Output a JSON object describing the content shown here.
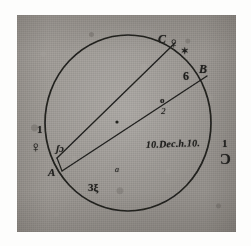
{
  "figure": {
    "kind": "manuscript-astronomical-sketch",
    "medium_note": "ink on aged paper",
    "paper_color": "#a9a5a0",
    "ink_color": "#20201e"
  },
  "circle": {
    "name": "field-of-view-circle",
    "center_x": 128,
    "center_y": 123,
    "radius_x": 83,
    "radius_y": 88
  },
  "chords": [
    {
      "id": "chord-upper",
      "from_label": "A",
      "to_label": "C",
      "x1": 57,
      "y1": 158,
      "x2": 175,
      "y2": 43
    },
    {
      "id": "chord-lower",
      "from_label": "A",
      "to_label": "B",
      "x1": 62,
      "y1": 171,
      "x2": 207,
      "y2": 76
    }
  ],
  "labels": {
    "point_a": "A",
    "point_b": "B",
    "point_c": "C",
    "digit_one_left": "1",
    "digit_six": "6",
    "digit_one_right": "1",
    "marker_a_lower": "a",
    "marker_small_o": "o",
    "marker_two": "2",
    "script_lower": "3ξ",
    "script_left": "ʃɔ",
    "date_note": "10.Dec.h.10."
  },
  "symbols": {
    "venus_left": "♀",
    "venus_top_right": "♀",
    "crescent_right": "Ɔ",
    "star_mark": "✶"
  },
  "colors": {
    "paper": "#a9a5a0",
    "ink": "#20201e",
    "margin": "#fdfdfc"
  }
}
